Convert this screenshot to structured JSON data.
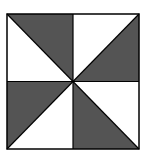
{
  "diagram": {
    "type": "pinwheel-quilt-block",
    "fill_color": "#545454",
    "background_color": "#ffffff",
    "stroke_color": "#000000",
    "square": {
      "x": 7,
      "y": 14,
      "size_w": 132,
      "size_h": 135
    },
    "center": {
      "x": 73,
      "y": 81.5
    },
    "triangles": [
      {
        "name": "top-left-shaded",
        "quadrant": "top-left",
        "shaded": true
      },
      {
        "name": "top-left-white",
        "quadrant": "top-left",
        "shaded": false
      },
      {
        "name": "top-right-shaded",
        "quadrant": "top-right",
        "shaded": true
      },
      {
        "name": "top-right-white",
        "quadrant": "top-right",
        "shaded": false
      },
      {
        "name": "bottom-left-shaded",
        "quadrant": "bottom-left",
        "shaded": true
      },
      {
        "name": "bottom-left-white",
        "quadrant": "bottom-left",
        "shaded": false
      },
      {
        "name": "bottom-right-shaded",
        "quadrant": "bottom-right",
        "shaded": true
      },
      {
        "name": "bottom-right-white",
        "quadrant": "bottom-right",
        "shaded": false
      }
    ]
  }
}
